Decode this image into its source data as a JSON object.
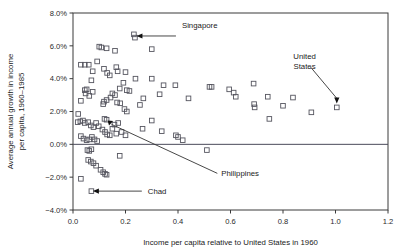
{
  "chart_data": {
    "type": "scatter",
    "title": "",
    "xlabel": "Income per capita relative to United States in 1960",
    "ylabel": "Average annual growth in income per capita, 1960–1985",
    "xlim": [
      0.0,
      1.2
    ],
    "ylim": [
      -4.0,
      8.0
    ],
    "xticks": [
      0.0,
      0.2,
      0.4,
      0.6,
      0.8,
      1.0,
      1.2
    ],
    "xticklabels": [
      "0.0",
      "0.2",
      "0.4",
      "0.6",
      "0.8",
      "1.0",
      "1.2"
    ],
    "yticks": [
      8.0,
      6.0,
      4.0,
      2.0,
      0.0,
      -2.0,
      -4.0
    ],
    "yticklabels": [
      "8.0%",
      "6.0%",
      "4.0%",
      "2.0%",
      "0.0%",
      "−2.0%",
      "−4.0%"
    ],
    "grid": false,
    "legend": false,
    "zero_reference_line": 0.0,
    "marker_style": "open-square",
    "marker_color": "#55555f",
    "points": [
      [
        0.03,
        4.85
      ],
      [
        0.045,
        4.85
      ],
      [
        0.06,
        4.85
      ],
      [
        0.1,
        5.95
      ],
      [
        0.108,
        5.9
      ],
      [
        0.128,
        5.85
      ],
      [
        0.16,
        5.7
      ],
      [
        0.232,
        6.7
      ],
      [
        0.236,
        6.5
      ],
      [
        0.3,
        5.8
      ],
      [
        0.092,
        5.05
      ],
      [
        0.118,
        4.6
      ],
      [
        0.13,
        4.35
      ],
      [
        0.14,
        4.2
      ],
      [
        0.075,
        4.45
      ],
      [
        0.165,
        4.7
      ],
      [
        0.17,
        4.45
      ],
      [
        0.2,
        4.4
      ],
      [
        0.238,
        4.0
      ],
      [
        0.3,
        4.0
      ],
      [
        0.192,
        3.75
      ],
      [
        0.178,
        3.4
      ],
      [
        0.205,
        3.3
      ],
      [
        0.215,
        3.25
      ],
      [
        0.15,
        3.1
      ],
      [
        0.16,
        3.0
      ],
      [
        0.143,
        2.85
      ],
      [
        0.128,
        2.7
      ],
      [
        0.118,
        2.6
      ],
      [
        0.115,
        2.45
      ],
      [
        0.168,
        2.55
      ],
      [
        0.18,
        2.5
      ],
      [
        0.196,
        2.15
      ],
      [
        0.205,
        2.0
      ],
      [
        0.045,
        3.3
      ],
      [
        0.052,
        3.35
      ],
      [
        0.048,
        3.1
      ],
      [
        0.062,
        2.95
      ],
      [
        0.07,
        3.9
      ],
      [
        0.075,
        3.2
      ],
      [
        0.03,
        2.65
      ],
      [
        0.255,
        2.4
      ],
      [
        0.268,
        2.8
      ],
      [
        0.33,
        3.05
      ],
      [
        0.345,
        3.6
      ],
      [
        0.39,
        3.6
      ],
      [
        0.44,
        2.8
      ],
      [
        0.52,
        3.5
      ],
      [
        0.528,
        3.5
      ],
      [
        0.595,
        3.35
      ],
      [
        0.612,
        3.15
      ],
      [
        0.62,
        2.9
      ],
      [
        0.688,
        3.7
      ],
      [
        0.69,
        2.45
      ],
      [
        0.692,
        2.25
      ],
      [
        0.742,
        2.9
      ],
      [
        0.8,
        2.35
      ],
      [
        0.838,
        2.85
      ],
      [
        0.748,
        1.55
      ],
      [
        0.908,
        1.95
      ],
      [
        1.005,
        2.25
      ],
      [
        0.3,
        1.45
      ],
      [
        0.338,
        0.8
      ],
      [
        0.392,
        0.55
      ],
      [
        0.4,
        0.45
      ],
      [
        0.418,
        0.25
      ],
      [
        0.265,
        0.95
      ],
      [
        0.51,
        -0.35
      ],
      [
        0.02,
        1.85
      ],
      [
        0.018,
        1.35
      ],
      [
        0.028,
        1.4
      ],
      [
        0.038,
        1.45
      ],
      [
        0.045,
        1.3
      ],
      [
        0.058,
        1.35
      ],
      [
        0.068,
        1.15
      ],
      [
        0.078,
        1.05
      ],
      [
        0.088,
        1.3
      ],
      [
        0.098,
        1.1
      ],
      [
        0.112,
        0.9
      ],
      [
        0.122,
        0.75
      ],
      [
        0.13,
        0.6
      ],
      [
        0.14,
        0.55
      ],
      [
        0.15,
        0.95
      ],
      [
        0.158,
        1.2
      ],
      [
        0.128,
        1.5
      ],
      [
        0.12,
        1.55
      ],
      [
        0.172,
        1.3
      ],
      [
        0.165,
        0.65
      ],
      [
        0.185,
        0.75
      ],
      [
        0.2,
        0.55
      ],
      [
        0.03,
        0.5
      ],
      [
        0.04,
        0.35
      ],
      [
        0.052,
        0.25
      ],
      [
        0.062,
        0.3
      ],
      [
        0.072,
        0.45
      ],
      [
        0.082,
        0.3
      ],
      [
        0.092,
        0.2
      ],
      [
        0.055,
        -0.35
      ],
      [
        0.062,
        -0.4
      ],
      [
        0.07,
        -0.3
      ],
      [
        0.058,
        -0.95
      ],
      [
        0.068,
        -1.05
      ],
      [
        0.078,
        -1.15
      ],
      [
        0.088,
        -1.3
      ],
      [
        0.105,
        -1.55
      ],
      [
        0.115,
        -1.7
      ],
      [
        0.122,
        -1.8
      ],
      [
        0.128,
        -1.85
      ],
      [
        0.03,
        -2.1
      ],
      [
        0.178,
        -0.7
      ],
      [
        0.07,
        -2.85
      ]
    ],
    "annotations": [
      {
        "label": "Singapore",
        "label_x": 0.415,
        "label_y": 7.25,
        "point_x": 0.236,
        "point_y": 6.6,
        "arrow": "left"
      },
      {
        "label": "United States",
        "label_lines": [
          "United",
          "States"
        ],
        "label_x": 0.905,
        "label_y": 4.95,
        "point_x": 1.005,
        "point_y": 2.25,
        "arrow": "down"
      },
      {
        "label": "Philippines",
        "label_x": 0.565,
        "label_y": -1.95,
        "point_x": 0.128,
        "point_y": 1.52,
        "arrow": "up-left"
      },
      {
        "label": "Chad",
        "label_x": 0.285,
        "label_y": -2.85,
        "point_x": 0.07,
        "point_y": -2.85,
        "arrow": "left"
      }
    ]
  }
}
